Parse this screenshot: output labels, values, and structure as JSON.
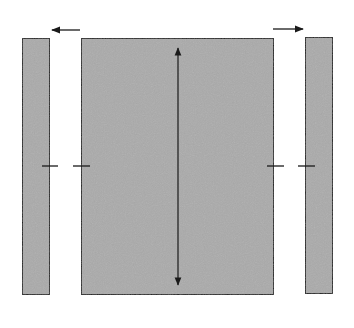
{
  "diagram": {
    "colors": {
      "fill": "#aaaaaa",
      "stroke": "#1a1a1a",
      "background": "#ffffff"
    },
    "shapes": {
      "left_strip": {
        "x": 22,
        "y": 38,
        "w": 28,
        "h": 257
      },
      "center_panel": {
        "x": 81,
        "y": 38,
        "w": 193,
        "h": 257
      },
      "right_strip": {
        "x": 305,
        "y": 37,
        "w": 28,
        "h": 257
      }
    },
    "arrows": {
      "left_outward": {
        "from": [
          80,
          30
        ],
        "to": [
          52,
          30
        ],
        "direction": "left"
      },
      "right_outward": {
        "from": [
          273,
          29
        ],
        "to": [
          303,
          29
        ],
        "direction": "right"
      },
      "center_height": {
        "x": 178,
        "y1": 40,
        "y2": 293,
        "type": "double-headed"
      }
    },
    "ticks": {
      "y": 166,
      "segments": [
        {
          "x1": 42,
          "x2": 58
        },
        {
          "x1": 73,
          "x2": 90
        },
        {
          "x1": 267,
          "x2": 284
        },
        {
          "x1": 298,
          "x2": 315
        }
      ]
    }
  }
}
